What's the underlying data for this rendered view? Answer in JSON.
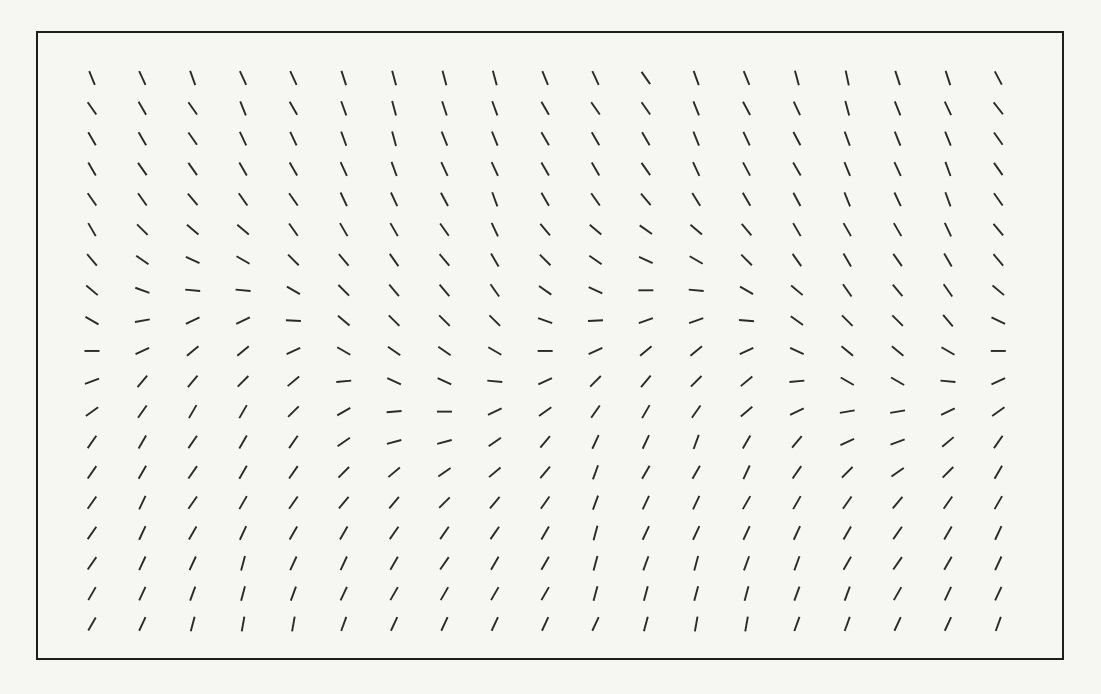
{
  "figure": {
    "type": "orientation-field",
    "frame": {
      "x": 36,
      "y": 31,
      "width": 1027,
      "height": 628,
      "border_color": "#1e1e1e"
    },
    "background_color": "#f6f6f3",
    "segment_color": "#2a2a2a",
    "segment_length": 15,
    "grid": {
      "cols": 19,
      "rows": 19,
      "origin_x": 92,
      "origin_y": 78,
      "spacing_x": 50.35,
      "spacing_y": 30.33
    },
    "angles": [
      [
        -68,
        -65,
        -70,
        -65,
        -65,
        -72,
        -75,
        -75,
        -75,
        -68,
        -65,
        -55,
        -70,
        -68,
        -75,
        -78,
        -72,
        -72,
        -62
      ],
      [
        -55,
        -60,
        -55,
        -68,
        -60,
        -70,
        -75,
        -72,
        -70,
        -60,
        -55,
        -55,
        -68,
        -62,
        -65,
        -75,
        -68,
        -65,
        -52
      ],
      [
        -60,
        -60,
        -55,
        -65,
        -65,
        -70,
        -75,
        -68,
        -68,
        -60,
        -60,
        -60,
        -68,
        -65,
        -62,
        -70,
        -68,
        -68,
        -55
      ],
      [
        -60,
        -55,
        -55,
        -60,
        -60,
        -65,
        -70,
        -65,
        -65,
        -60,
        -60,
        -55,
        -65,
        -62,
        -60,
        -68,
        -65,
        -70,
        -55
      ],
      [
        -55,
        -55,
        -50,
        -55,
        -55,
        -65,
        -65,
        -62,
        -70,
        -60,
        -55,
        -50,
        -58,
        -60,
        -62,
        -68,
        -65,
        -70,
        -55
      ],
      [
        -60,
        -45,
        -40,
        -40,
        -55,
        -60,
        -60,
        -55,
        -65,
        -50,
        -40,
        -35,
        -40,
        -50,
        -60,
        -60,
        -60,
        -65,
        -50
      ],
      [
        -50,
        -35,
        -25,
        -30,
        -45,
        -50,
        -55,
        -50,
        -60,
        -45,
        -35,
        -25,
        -30,
        -45,
        -55,
        -60,
        -55,
        -60,
        -50
      ],
      [
        -40,
        -20,
        -5,
        -5,
        -30,
        -45,
        -50,
        -50,
        -55,
        -35,
        -25,
        0,
        -5,
        -30,
        -40,
        -55,
        -50,
        -55,
        -40
      ],
      [
        -30,
        10,
        25,
        25,
        -3,
        -40,
        -45,
        -45,
        -45,
        -20,
        3,
        20,
        20,
        -5,
        -35,
        -45,
        -45,
        -50,
        -25
      ],
      [
        0,
        25,
        40,
        40,
        25,
        -30,
        -35,
        -35,
        -30,
        0,
        25,
        40,
        40,
        25,
        -25,
        -40,
        -40,
        -30,
        0
      ],
      [
        20,
        50,
        50,
        45,
        40,
        5,
        -25,
        -25,
        -5,
        25,
        45,
        50,
        45,
        40,
        5,
        -30,
        -30,
        -5,
        25
      ],
      [
        35,
        55,
        60,
        60,
        45,
        30,
        5,
        0,
        25,
        35,
        55,
        60,
        55,
        40,
        25,
        10,
        10,
        25,
        35
      ],
      [
        55,
        60,
        55,
        60,
        55,
        35,
        15,
        15,
        35,
        50,
        65,
        65,
        70,
        60,
        50,
        25,
        20,
        40,
        55
      ],
      [
        55,
        60,
        55,
        60,
        55,
        45,
        40,
        35,
        40,
        50,
        70,
        60,
        60,
        65,
        55,
        45,
        35,
        45,
        60
      ],
      [
        55,
        65,
        55,
        60,
        55,
        50,
        50,
        45,
        50,
        55,
        70,
        65,
        65,
        60,
        60,
        55,
        50,
        55,
        60
      ],
      [
        55,
        65,
        60,
        65,
        60,
        60,
        55,
        55,
        55,
        60,
        75,
        65,
        65,
        65,
        65,
        60,
        55,
        60,
        65
      ],
      [
        55,
        65,
        65,
        75,
        65,
        65,
        60,
        55,
        60,
        60,
        75,
        70,
        75,
        70,
        70,
        60,
        55,
        60,
        65
      ],
      [
        60,
        65,
        70,
        75,
        70,
        65,
        60,
        60,
        60,
        60,
        75,
        75,
        75,
        75,
        70,
        70,
        60,
        65,
        65
      ],
      [
        60,
        65,
        75,
        80,
        80,
        70,
        65,
        65,
        65,
        65,
        65,
        75,
        80,
        80,
        70,
        70,
        65,
        65,
        70
      ]
    ]
  }
}
